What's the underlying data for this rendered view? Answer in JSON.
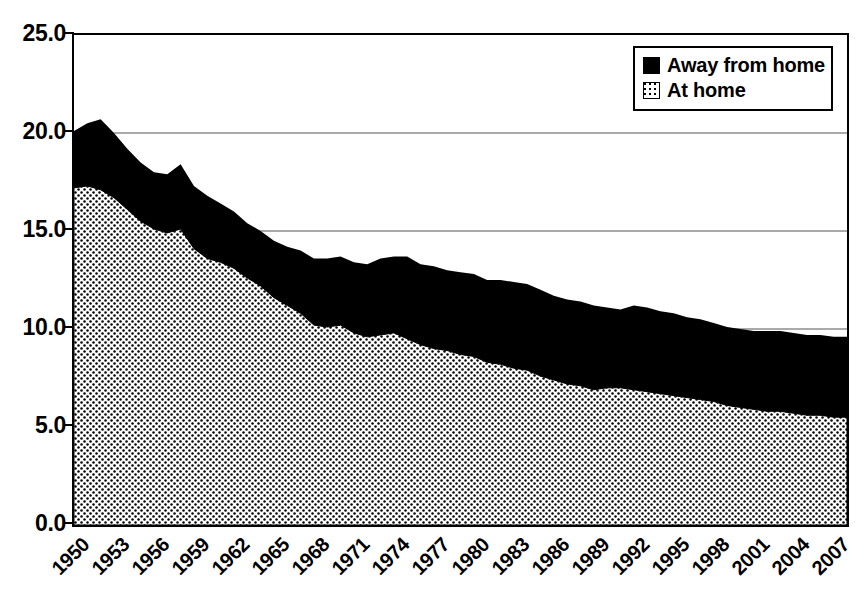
{
  "chart_data": {
    "type": "area",
    "stacked": true,
    "title": "",
    "subtitle": "",
    "xlabel": "",
    "ylabel": "",
    "xlim": [
      1950,
      2008
    ],
    "ylim": [
      0.0,
      25.0
    ],
    "y_ticks": [
      "0.0",
      "5.0",
      "10.0",
      "15.0",
      "20.0",
      "25.0"
    ],
    "y_tick_values": [
      0.0,
      5.0,
      10.0,
      15.0,
      20.0,
      25.0
    ],
    "grid": "horizontal",
    "legend_position": "top-right",
    "x_tick_labels": [
      "1950",
      "1953",
      "1956",
      "1959",
      "1962",
      "1965",
      "1968",
      "1971",
      "1974",
      "1977",
      "1980",
      "1983",
      "1986",
      "1989",
      "1992",
      "1995",
      "1998",
      "2001",
      "2004",
      "2007"
    ],
    "x": [
      1950,
      1951,
      1952,
      1953,
      1954,
      1955,
      1956,
      1957,
      1958,
      1959,
      1960,
      1961,
      1962,
      1963,
      1964,
      1965,
      1966,
      1967,
      1968,
      1969,
      1970,
      1971,
      1972,
      1973,
      1974,
      1975,
      1976,
      1977,
      1978,
      1979,
      1980,
      1981,
      1982,
      1983,
      1984,
      1985,
      1986,
      1987,
      1988,
      1989,
      1990,
      1991,
      1992,
      1993,
      1994,
      1995,
      1996,
      1997,
      1998,
      1999,
      2000,
      2001,
      2002,
      2003,
      2004,
      2005,
      2006,
      2007,
      2008
    ],
    "series": [
      {
        "name": "At home",
        "fill": "dotted",
        "color": "#ffffff",
        "values": [
          17.2,
          17.3,
          17.1,
          16.7,
          16.1,
          15.5,
          15.1,
          14.9,
          15.1,
          14.1,
          13.6,
          13.4,
          13.1,
          12.6,
          12.2,
          11.6,
          11.2,
          10.8,
          10.2,
          10.1,
          10.2,
          9.8,
          9.6,
          9.7,
          9.8,
          9.5,
          9.2,
          9.0,
          8.9,
          8.7,
          8.6,
          8.3,
          8.2,
          8.0,
          7.9,
          7.6,
          7.4,
          7.2,
          7.1,
          6.9,
          7.0,
          7.0,
          6.9,
          6.8,
          6.7,
          6.6,
          6.5,
          6.4,
          6.3,
          6.1,
          6.0,
          5.9,
          5.8,
          5.8,
          5.7,
          5.6,
          5.6,
          5.5,
          5.5
        ]
      },
      {
        "name": "Away from home",
        "fill": "solid",
        "color": "#000000",
        "values": [
          2.9,
          3.2,
          3.6,
          3.3,
          3.1,
          3.0,
          2.9,
          3.0,
          3.3,
          3.2,
          3.2,
          3.0,
          2.9,
          2.8,
          2.8,
          2.9,
          3.0,
          3.2,
          3.4,
          3.5,
          3.5,
          3.6,
          3.7,
          3.9,
          3.9,
          4.2,
          4.1,
          4.2,
          4.1,
          4.2,
          4.2,
          4.2,
          4.3,
          4.4,
          4.4,
          4.4,
          4.3,
          4.3,
          4.3,
          4.3,
          4.1,
          4.0,
          4.3,
          4.3,
          4.2,
          4.2,
          4.1,
          4.1,
          4.0,
          4.0,
          4.0,
          4.0,
          4.1,
          4.1,
          4.1,
          4.1,
          4.1,
          4.1,
          4.1
        ]
      }
    ],
    "totals": [
      20.1,
      20.5,
      20.7,
      20.0,
      19.2,
      18.5,
      18.0,
      17.9,
      18.4,
      17.3,
      16.8,
      16.4,
      16.0,
      15.4,
      15.0,
      14.5,
      14.2,
      14.0,
      13.6,
      13.6,
      13.7,
      13.4,
      13.3,
      13.6,
      13.7,
      13.7,
      13.3,
      13.2,
      13.0,
      12.9,
      12.8,
      12.5,
      12.5,
      12.4,
      12.3,
      12.0,
      11.7,
      11.5,
      11.4,
      11.2,
      11.1,
      11.0,
      11.2,
      11.1,
      10.9,
      10.8,
      10.6,
      10.5,
      10.3,
      10.1,
      10.0,
      9.9,
      9.9,
      9.9,
      9.8,
      9.7,
      9.7,
      9.6,
      9.6
    ]
  },
  "legend": {
    "items": [
      {
        "label": "Away from home",
        "swatch": "solid"
      },
      {
        "label": "At home",
        "swatch": "dotted"
      }
    ]
  },
  "axis": {
    "y_labels": [
      "25.0",
      "20.0",
      "15.0",
      "10.0",
      "5.0",
      "0.0"
    ]
  }
}
